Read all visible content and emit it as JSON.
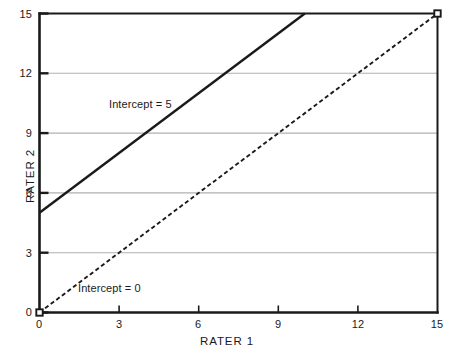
{
  "chart_data": {
    "type": "line",
    "title": "",
    "subtitle": "",
    "xlabel": "RATER 1",
    "ylabel": "RATER 2",
    "xlim": [
      0,
      15
    ],
    "ylim": [
      0,
      15
    ],
    "xticks": [
      "0",
      "3",
      "6",
      "9",
      "12",
      "15"
    ],
    "xtick_values": [
      0,
      3,
      6,
      9,
      12,
      15
    ],
    "yticks": [
      "0",
      "3",
      "6",
      "9",
      "12",
      "15"
    ],
    "ytick_values": [
      0,
      3,
      6,
      9,
      12,
      15
    ],
    "grid": "horizontal",
    "gridline_values": [
      3,
      6,
      9,
      12
    ],
    "grid_color": "#b0b0b0",
    "axis_color": "#1a1a1a",
    "background": "#ffffff",
    "legend": "none",
    "series": [
      {
        "name": "Intercept = 5",
        "style": "solid",
        "color": "#1a1a1a",
        "slope": 1,
        "intercept": 5,
        "x": [
          0,
          10
        ],
        "values": [
          5,
          15
        ],
        "markers": "none"
      },
      {
        "name": "Intercept = 0",
        "style": "dashed",
        "color": "#1a1a1a",
        "slope": 1,
        "intercept": 0,
        "x": [
          0,
          15
        ],
        "values": [
          0,
          15
        ],
        "markers": "square-endpoints"
      }
    ],
    "annotations": [
      {
        "text": "Intercept = 5",
        "x": 4.35,
        "y": 10.35
      },
      {
        "text": "Intercept = 0",
        "x": 2.45,
        "y": 1.12
      }
    ]
  },
  "axes": {
    "x_title": "RATER 1",
    "y_title": "RATER 2"
  },
  "ticks": {
    "x": [
      "0",
      "3",
      "6",
      "9",
      "12",
      "15"
    ],
    "y": [
      "0",
      "3",
      "6",
      "9",
      "12",
      "15"
    ]
  },
  "annotations": {
    "intercept5": "Intercept = 5",
    "intercept0": "Intercept = 0"
  }
}
